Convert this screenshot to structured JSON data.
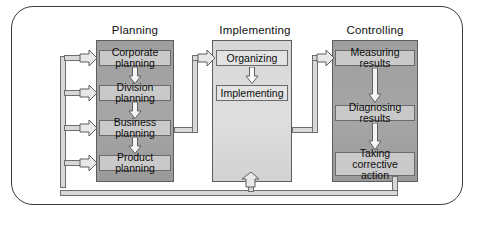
{
  "diagram": {
    "columns": [
      {
        "id": "planning",
        "header": "Planning",
        "shade": "dark",
        "items": [
          {
            "label": "Corporate planning"
          },
          {
            "label": "Division planning"
          },
          {
            "label": "Business planning"
          },
          {
            "label": "Product planning"
          }
        ]
      },
      {
        "id": "implementing",
        "header": "Implementing",
        "shade": "light",
        "items": [
          {
            "label": "Organizing"
          },
          {
            "label": "Implementing"
          }
        ]
      },
      {
        "id": "controlling",
        "header": "Controlling",
        "shade": "dark",
        "items": [
          {
            "label": "Measuring results"
          },
          {
            "label": "Diagnosing results"
          },
          {
            "label": "Taking corrective\naction"
          }
        ]
      }
    ],
    "connectors": [
      {
        "id": "planning-to-implementing",
        "from": "Business planning",
        "to": "Organizing"
      },
      {
        "id": "implementing-to-controlling",
        "from": "Implementing",
        "to": "Measuring results"
      },
      {
        "id": "feedback-to-planning",
        "from": "Taking corrective action",
        "to": "Planning items"
      },
      {
        "id": "feedback-to-implementing",
        "from": "Taking corrective action",
        "to": "Implementing"
      }
    ],
    "colors": {
      "panel_dark": "#a2a2a2",
      "panel_light": "#d9d9d9",
      "chip_dark": "#c9c9c9",
      "chip_light": "#e3e3e3",
      "line": "#6e6e6e",
      "line_fill": "#d8d8d8",
      "border": "#3a3a3a",
      "text": "#0d0d0d",
      "background": "#ffffff"
    }
  }
}
